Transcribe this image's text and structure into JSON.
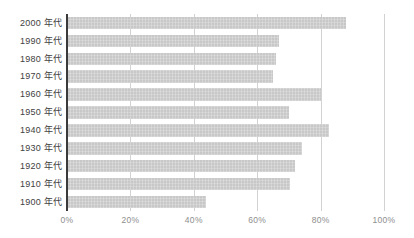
{
  "chart_data": {
    "type": "bar",
    "orientation": "horizontal",
    "title": "",
    "xlabel": "",
    "ylabel": "",
    "categories": [
      "2000 年代",
      "1990 年代",
      "1980 年代",
      "1970 年代",
      "1960 年代",
      "1950 年代",
      "1940 年代",
      "1930 年代",
      "1920 年代",
      "1910 年代",
      "1900 年代"
    ],
    "values": [
      88,
      67,
      66,
      65,
      80,
      70,
      82.5,
      74,
      72,
      70.5,
      44
    ],
    "value_unit": "%",
    "x_tick_labels": [
      "0%",
      "20%",
      "40%",
      "60%",
      "80%",
      "100%"
    ],
    "x_tick_values": [
      0,
      20,
      40,
      60,
      80,
      100
    ],
    "xlim": [
      0,
      100
    ],
    "grid": true,
    "legend": false,
    "colors": {
      "bar": "#c8c8c8",
      "gridline": "#d2d2d2",
      "axis_line": "#3a3a3a",
      "category_label": "#414141",
      "tick_label": "#8e8e8e",
      "background": "#ffffff"
    }
  }
}
